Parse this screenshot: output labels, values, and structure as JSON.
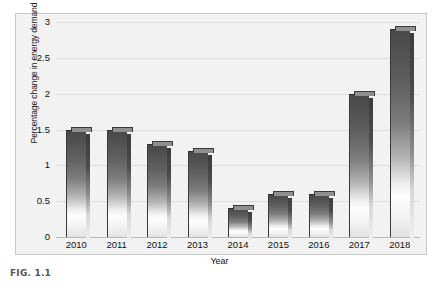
{
  "caption": "FIG. 1.1",
  "chart_data": {
    "type": "bar",
    "title": "",
    "xlabel": "Year",
    "ylabel": "Percentage change in energy demand",
    "categories": [
      "2010",
      "2011",
      "2012",
      "2013",
      "2014",
      "2015",
      "2016",
      "2017",
      "2018"
    ],
    "values": [
      1.5,
      1.5,
      1.3,
      1.2,
      0.4,
      0.6,
      0.6,
      2.0,
      2.9
    ],
    "ylim": [
      0,
      3
    ],
    "ytick_labels": [
      "0",
      "0.5",
      "1",
      "1.5",
      "2",
      "2.5",
      "3"
    ],
    "ytick_values": [
      0,
      0.5,
      1,
      1.5,
      2,
      2.5,
      3
    ],
    "grid": true,
    "legend": "none",
    "plot_background": "#f2f2f2",
    "bar_color_top": "#4a4a4a",
    "bar_color_bottom": "#fdfdfd",
    "gridline_color": "#dcdcdc"
  }
}
